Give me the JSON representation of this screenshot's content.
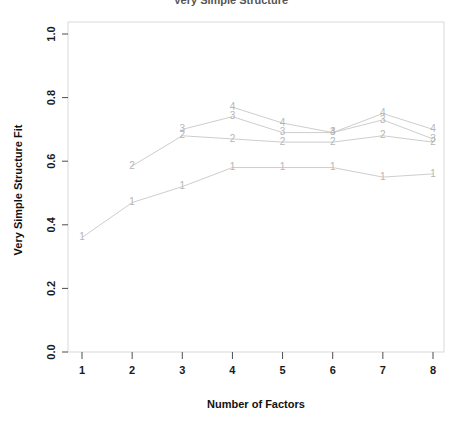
{
  "chart_data": {
    "type": "line",
    "title": "Very Simple Structure",
    "xlabel": "Number of Factors",
    "ylabel": "Very Simple Structure Fit",
    "x": [
      1,
      2,
      3,
      4,
      5,
      6,
      7,
      8
    ],
    "xtick_labels": [
      "1",
      "2",
      "3",
      "4",
      "5",
      "6",
      "7",
      "8"
    ],
    "ytick_labels": [
      "0.0",
      "0.2",
      "0.4",
      "0.6",
      "0.8",
      "1.0"
    ],
    "ytick_values": [
      0.0,
      0.2,
      0.4,
      0.6,
      0.8,
      1.0
    ],
    "xlim": [
      0.7,
      8.3
    ],
    "ylim": [
      0.0,
      1.0
    ],
    "grid": false,
    "legend": "none",
    "point_marker_style": "complexity-number",
    "series": [
      {
        "name": "1",
        "label": "1",
        "color": "#b5b5b5",
        "x": [
          1,
          2,
          3,
          4,
          5,
          6,
          7,
          8
        ],
        "values": [
          0.36,
          0.47,
          0.52,
          0.58,
          0.58,
          0.58,
          0.55,
          0.56
        ]
      },
      {
        "name": "2",
        "label": "2",
        "color": "#b5b5b5",
        "x": [
          3,
          4,
          5,
          6,
          7,
          8
        ],
        "values": [
          0.68,
          0.67,
          0.66,
          0.66,
          0.68,
          0.66
        ]
      },
      {
        "name": "3",
        "label": "3",
        "color": "#b5b5b5",
        "x": [
          3,
          4,
          5,
          6,
          7,
          8
        ],
        "values": [
          0.7,
          0.74,
          0.69,
          0.69,
          0.73,
          0.67
        ]
      },
      {
        "name": "4",
        "label": "4",
        "color": "#b5b5b5",
        "x": [
          4,
          5,
          6,
          7,
          8
        ],
        "values": [
          0.77,
          0.72,
          0.69,
          0.75,
          0.7
        ]
      }
    ],
    "extra_series_points": [
      {
        "series": "2",
        "x": 2,
        "value": 0.585
      }
    ]
  },
  "axis": {
    "x_title": "Number of Factors",
    "y_title": "Very Simple Structure Fit"
  }
}
